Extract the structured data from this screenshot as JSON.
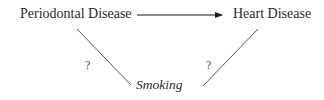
{
  "diagram": {
    "nodes": {
      "periodontal": "Periodontal Disease",
      "heart": "Heart Disease",
      "smoking": "Smoking"
    },
    "edges": [
      {
        "from": "Periodontal Disease",
        "to": "Heart Disease",
        "type": "arrow",
        "label": ""
      },
      {
        "from": "Periodontal Disease",
        "to": "Smoking",
        "type": "line",
        "label": "?"
      },
      {
        "from": "Heart Disease",
        "to": "Smoking",
        "type": "line",
        "label": "?"
      }
    ],
    "edge_labels": {
      "left": "?",
      "right": "?"
    }
  }
}
